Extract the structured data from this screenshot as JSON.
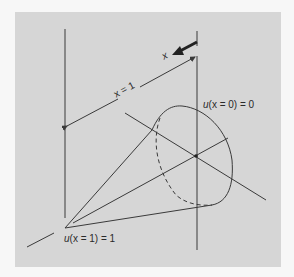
{
  "figure": {
    "background_color": "#d6d6d6",
    "line_color": "#3a3a3a",
    "labels": {
      "x_arrow": "x",
      "distance": "x = 1",
      "boundary_top": "u(x = 0) = 0",
      "boundary_bottom": "u(x = 1) = 1"
    },
    "labels_parts": {
      "top_u": "u",
      "top_rest": "(x = 0) = 0",
      "bottom_u": "u",
      "bottom_rest": "(x = 1) = 1"
    }
  }
}
